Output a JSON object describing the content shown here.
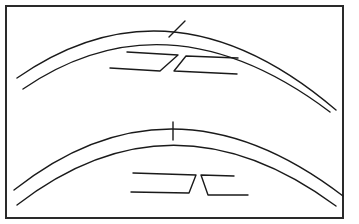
{
  "diagram": {
    "type": "line-drawing",
    "stroke_color": "#1a1a1a",
    "background_color": "#ffffff",
    "panels": [
      {
        "id": "top",
        "arcs": 2,
        "connector": "slanted",
        "joint_pair": "offset slanted brackets"
      },
      {
        "id": "bottom",
        "arcs": 2,
        "connector": "vertical",
        "joint_pair": "mirrored brackets with gap"
      }
    ]
  }
}
